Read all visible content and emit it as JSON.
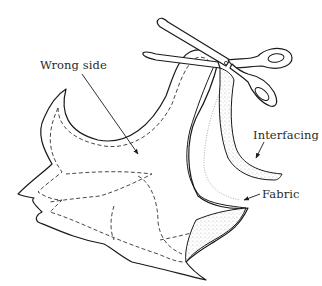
{
  "figure": {
    "labels": {
      "wrong_side": "Wrong side",
      "interfacing": "Interfacing",
      "fabric": "Fabric"
    },
    "elements": [
      {
        "name": "scissors",
        "role": "trimming tool"
      },
      {
        "name": "fabric-piece",
        "role": "facing shown wrong side up with dashed stitching lines"
      },
      {
        "name": "interfacing-strip",
        "role": "trimmed stippled edge strip"
      }
    ],
    "colors": {
      "line": "#1a1a1a",
      "text": "#2a2a2a",
      "background": "#ffffff"
    }
  }
}
